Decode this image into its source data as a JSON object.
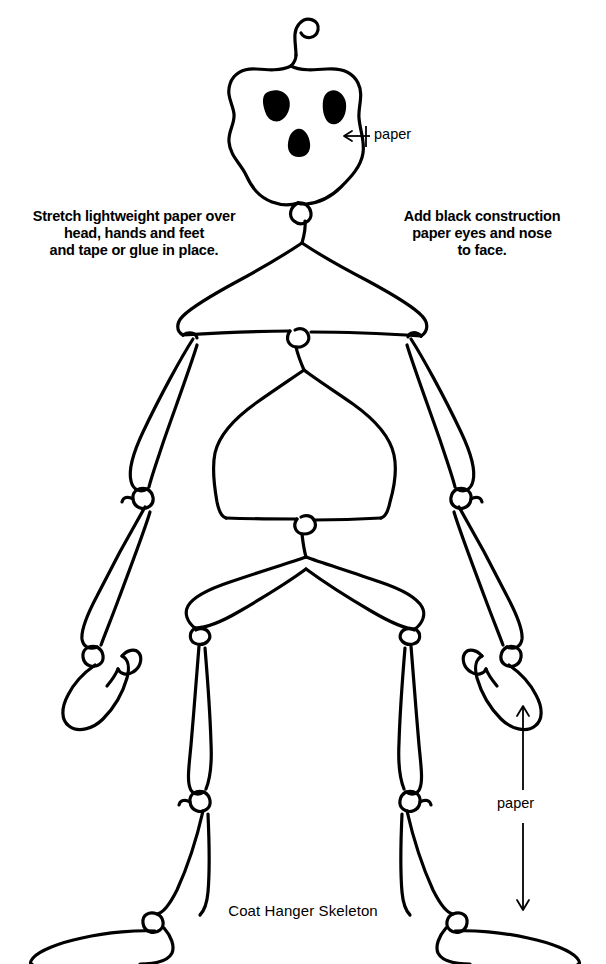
{
  "page": {
    "title": "Coat Hanger Skeleton",
    "background_color": "#ffffff",
    "ink_color": "#000000",
    "width": 606,
    "height": 964
  },
  "captions": {
    "left": "Stretch lightweight paper over\nhead, hands and feet\nand tape or glue in place.",
    "right": "Add black construction\npaper eyes and nose\nto face."
  },
  "annotations": {
    "head_paper_label": "paper",
    "leg_paper_label": "paper"
  },
  "figure": {
    "name": "coat-hanger-skeleton-diagram",
    "parts": [
      "hanger-hook",
      "skull",
      "left-eye",
      "right-eye",
      "nose",
      "neck-joint",
      "shoulder-hanger",
      "ribcage-hanger",
      "pelvis-hanger",
      "left-upper-arm",
      "left-forearm",
      "left-hand",
      "right-upper-arm",
      "right-forearm",
      "right-hand",
      "left-thigh",
      "left-shin",
      "left-foot",
      "right-thigh",
      "right-shin",
      "right-foot"
    ]
  }
}
